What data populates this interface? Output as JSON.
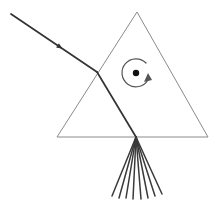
{
  "figure": {
    "background_color": "#ffffff",
    "width": 220,
    "height": 204
  },
  "colors": {
    "prism_outline": "#8a8a8a",
    "ray": "#333333",
    "dispersion_ray": "#3a3a3a",
    "rotation_symbol": "#555555",
    "center_dot": "#111111"
  },
  "prism": {
    "name": "triangular-prism",
    "shape": "triangle",
    "stroke_width": 1,
    "vertices": [
      {
        "label": "apex",
        "x": 137,
        "y": 12
      },
      {
        "label": "bottom-left",
        "x": 57,
        "y": 137
      },
      {
        "label": "bottom-right",
        "x": 208,
        "y": 137
      }
    ]
  },
  "incident_ray": {
    "name": "incident-ray",
    "from": {
      "x": 11,
      "y": 14
    },
    "to": {
      "x": 97,
      "y": 72
    },
    "stroke_width": 1.7,
    "arrowhead": {
      "x": 60,
      "y": 47,
      "size": 6,
      "direction": "down-right"
    }
  },
  "internal_ray": {
    "name": "refracted-internal-ray",
    "from": {
      "x": 97,
      "y": 72
    },
    "to": {
      "x": 136,
      "y": 137
    },
    "stroke_width": 1.7
  },
  "dispersion_fan": {
    "name": "dispersion-fan",
    "origin": {
      "x": 136,
      "y": 137
    },
    "ray_count": 8,
    "stroke_width": 1.5,
    "endpoints": [
      {
        "x": 112,
        "y": 196
      },
      {
        "x": 119,
        "y": 198
      },
      {
        "x": 126,
        "y": 198
      },
      {
        "x": 133,
        "y": 199
      },
      {
        "x": 141,
        "y": 199
      },
      {
        "x": 148,
        "y": 198
      },
      {
        "x": 155,
        "y": 196
      },
      {
        "x": 162,
        "y": 194
      }
    ]
  },
  "rotation_symbol": {
    "name": "rotation-arrow",
    "center": {
      "x": 136,
      "y": 73
    },
    "radius": 14,
    "dot_radius": 3.2,
    "direction": "clockwise",
    "arc_path": "M 146 63 A 14 14 0 1 0 148 80",
    "arrowhead_points": "144,82 152,80 148,73",
    "stroke_width": 1.2
  }
}
